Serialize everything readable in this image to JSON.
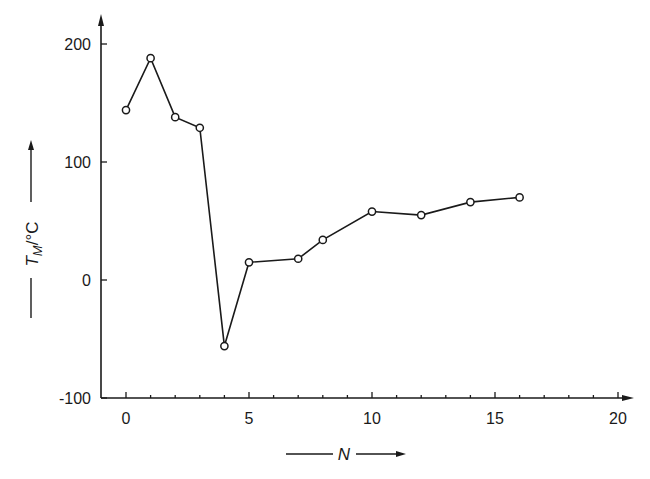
{
  "chart_data": {
    "type": "line",
    "title": "",
    "xlabel": "N",
    "ylabel": "T_M/°C",
    "ylabel_main": "T",
    "ylabel_sub": "M",
    "ylabel_unit": "/°C",
    "x": [
      0,
      1,
      2,
      3,
      4,
      5,
      7,
      8,
      10,
      12,
      14,
      16
    ],
    "series": [
      {
        "name": "T_M",
        "values": [
          144,
          188,
          138,
          129,
          -56,
          15,
          18,
          34,
          58,
          55,
          66,
          70
        ]
      }
    ],
    "xlim": [
      -1,
      20.5
    ],
    "ylim": [
      -100,
      210
    ],
    "xticks": [
      0,
      5,
      10,
      15,
      20
    ],
    "xtick_labels": [
      "0",
      "5",
      "10",
      "15",
      "20"
    ],
    "yticks": [
      -100,
      0,
      100,
      200
    ],
    "ytick_labels": [
      "-100",
      "0",
      "100",
      "200"
    ],
    "grid": false,
    "legend": "none",
    "marker": "open-circle",
    "line_color": "#1a1a1a"
  }
}
